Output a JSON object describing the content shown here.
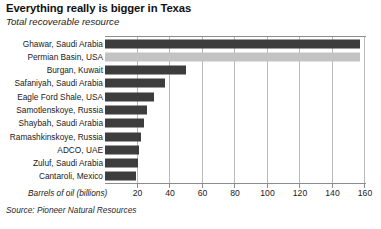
{
  "header": {
    "title": "Everything really is bigger in Texas",
    "subtitle": "Total recoverable resource"
  },
  "footer": {
    "source": "Source: Pioneer Natural Resources"
  },
  "colors": {
    "bar": "#3d3d3d",
    "bar_highlight": "#c3c3c3",
    "gridline": "#b9b9b9",
    "axis": "#8d8d8d",
    "background": "#ffffff",
    "text": "#1a1a1a"
  },
  "chart_data": {
    "type": "bar",
    "orientation": "horizontal",
    "title": "Everything really is bigger in Texas",
    "subtitle": "Total recoverable resource",
    "xlabel": "Barrels of oil (billions)",
    "ylabel": "",
    "xlim": [
      0,
      160
    ],
    "xticks": [
      20,
      40,
      60,
      80,
      100,
      120,
      140,
      160
    ],
    "grid": "vertical",
    "legend": "none",
    "highlight_category": "Permian Basin, USA",
    "categories": [
      "Ghawar, Saudi Arabia",
      "Permian Basin, USA",
      "Burgan, Kuwait",
      "Safaniyah, Saudi Arabia",
      "Eagle Ford Shale, USA",
      "Samotlenskoye, Russia",
      "Shaybah, Saudi Arabia",
      "Ramashkinskoye, Russia",
      "ADCO, UAE",
      "Zuluf, Saudi Arabia",
      "Cantaroli, Mexico"
    ],
    "values": [
      157,
      157,
      50,
      37,
      30,
      26,
      24,
      22,
      21,
      20,
      19
    ],
    "series": [
      {
        "name": "Total recoverable resource",
        "values": [
          157,
          157,
          50,
          37,
          30,
          26,
          24,
          22,
          21,
          20,
          19
        ]
      }
    ]
  }
}
